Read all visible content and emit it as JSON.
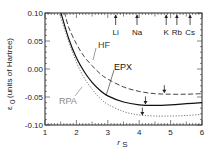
{
  "chart_data": {
    "type": "line",
    "title": "",
    "xlabel": "r_s",
    "ylabel": "ε_0 (units of Hartree)",
    "xlim": [
      1,
      6
    ],
    "ylim": [
      -0.1,
      0.1
    ],
    "x_ticks": [
      "1",
      "2",
      "3",
      "4",
      "5",
      "6"
    ],
    "y_ticks": [
      "0.10",
      "0.05",
      "0.00",
      "-0.05",
      "-0.10"
    ],
    "grid": false,
    "legend": "inline labels",
    "x": [
      1.5,
      1.75,
      2.0,
      2.25,
      2.5,
      2.75,
      3.0,
      3.5,
      4.0,
      4.5,
      5.0,
      5.5,
      6.0
    ],
    "series": [
      {
        "name": "HF",
        "style": "dashed",
        "color": "#444444",
        "values": [
          0.1,
          0.075,
          0.045,
          0.022,
          0.006,
          -0.008,
          -0.018,
          -0.032,
          -0.04,
          -0.044,
          -0.045,
          -0.045,
          -0.044
        ],
        "minimum": {
          "rs": 4.8,
          "value": -0.045
        }
      },
      {
        "name": "EPX",
        "style": "solid",
        "color": "#111111",
        "values": [
          0.1,
          0.055,
          0.02,
          -0.005,
          -0.024,
          -0.038,
          -0.048,
          -0.059,
          -0.064,
          -0.065,
          -0.064,
          -0.062,
          -0.06
        ],
        "minimum": {
          "rs": 4.2,
          "value": -0.065
        }
      },
      {
        "name": "RPA",
        "style": "dotted",
        "color": "#777777",
        "values": [
          0.1,
          0.05,
          0.012,
          -0.016,
          -0.036,
          -0.052,
          -0.063,
          -0.076,
          -0.082,
          -0.084,
          -0.084,
          -0.083,
          -0.081
        ],
        "minimum": {
          "rs": 4.1,
          "value": -0.085
        }
      }
    ],
    "annotations": [
      {
        "label": "Li",
        "rs": 3.25
      },
      {
        "label": "Na",
        "rs": 3.93
      },
      {
        "label": "K",
        "rs": 4.86
      },
      {
        "label": "Rb",
        "rs": 5.2
      },
      {
        "label": "Cs",
        "rs": 5.62
      }
    ]
  },
  "labels": {
    "hf": "HF",
    "epx": "EPX",
    "rpa": "RPA",
    "xaxis": "r",
    "xaxis_sub": "S",
    "yaxis_sym": "ε",
    "yaxis_sub": "0",
    "yaxis_units": "(units of Hartree)"
  }
}
